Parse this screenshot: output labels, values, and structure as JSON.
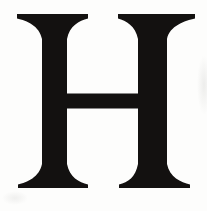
{
  "image": {
    "description": "Scanned print of a large serif capital letter H, black ink on white paper",
    "letter": "H",
    "letter_color": "#131110",
    "background_color": "#fdfdfc"
  }
}
